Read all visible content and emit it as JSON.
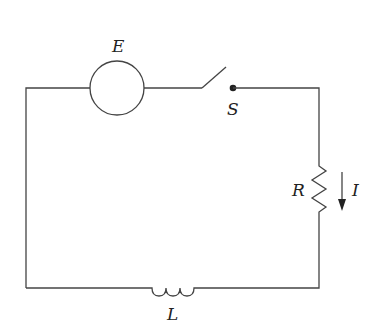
{
  "diagram": {
    "type": "circuit-schematic",
    "colors": {
      "background": "#ffffff",
      "wire": "#444444",
      "text": "#222222"
    },
    "components": {
      "source": {
        "label": "E",
        "symbol": "circle"
      },
      "switch": {
        "label": "S",
        "state": "open"
      },
      "resistor": {
        "label": "R"
      },
      "current": {
        "label": "I",
        "direction": "down"
      },
      "inductor": {
        "label": "L"
      }
    }
  }
}
